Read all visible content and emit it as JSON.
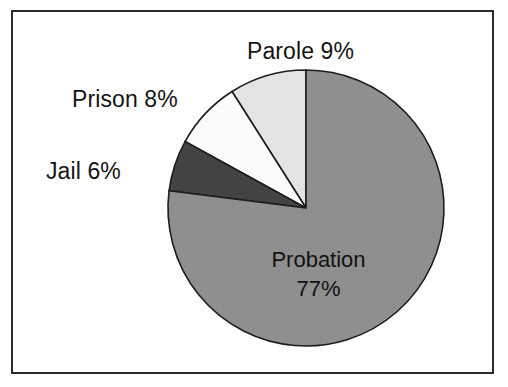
{
  "figure": {
    "background_color": "#ffffff",
    "frame_color": "#2b2b2b",
    "slice_outline_color": "#1e1e1e"
  },
  "labels": {
    "parole": "Parole 9%",
    "prison": "Prison 8%",
    "jail": "Jail 6%",
    "probation_name": "Probation",
    "probation_pct": "77%"
  },
  "chart_data": {
    "type": "pie",
    "title": "",
    "subtitle": "",
    "xlabel": "",
    "ylabel": "",
    "grid": false,
    "legend": false,
    "legend_position": "none",
    "labels_placement": "outside-callouts-and-inside-largest-slice",
    "units": "percent",
    "total": 100,
    "start_angle_deg": 90,
    "direction": "counterclockwise",
    "center": {
      "x": 306,
      "y": 208
    },
    "radius": 138,
    "categories": [
      "Parole",
      "Prison",
      "Jail",
      "Probation"
    ],
    "values": [
      9,
      8,
      6,
      77
    ],
    "annotations": [
      "Parole 9%",
      "Prison 8%",
      "Jail 6%",
      "Probation 77%"
    ],
    "slices": [
      {
        "label": "Parole",
        "value": 9,
        "display": "Parole 9%",
        "color": "#e3e3e3",
        "start_angle_deg": 90,
        "end_angle_deg": 122.4
      },
      {
        "label": "Prison",
        "value": 8,
        "display": "Prison 8%",
        "color": "#fbfbfb",
        "start_angle_deg": 122.4,
        "end_angle_deg": 151.2
      },
      {
        "label": "Jail",
        "value": 6,
        "display": "Jail 6%",
        "color": "#434343",
        "start_angle_deg": 151.2,
        "end_angle_deg": 172.8
      },
      {
        "label": "Probation",
        "value": 77,
        "display": "Probation 77%",
        "color": "#8f8f8f",
        "start_angle_deg": 172.8,
        "end_angle_deg": 450
      }
    ]
  }
}
